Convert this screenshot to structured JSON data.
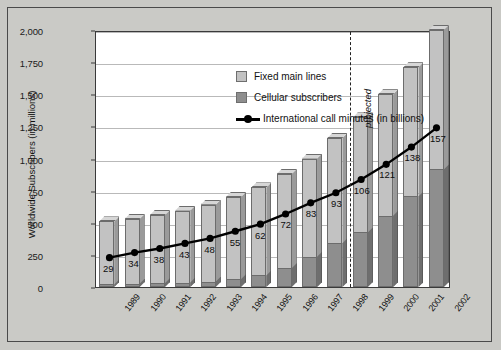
{
  "chart_data": {
    "type": "bar",
    "title": "",
    "subtitle": "",
    "xlabel": "",
    "ylabel": "Worldwide Subscribers (in millions)",
    "ylim": [
      0,
      2000
    ],
    "ytick_labels": [
      "2,000",
      "1,750",
      "1,500",
      "1,250",
      "1,000",
      "750",
      "500",
      "250",
      "0"
    ],
    "ytick_values": [
      2000,
      1750,
      1500,
      1250,
      1000,
      750,
      500,
      250,
      0
    ],
    "grid": true,
    "legend_position": "top-left",
    "stacked": true,
    "categories": [
      "1989",
      "1990",
      "1991",
      "1992",
      "1993",
      "1994",
      "1995",
      "1996",
      "1997",
      "1998",
      "1999",
      "2000",
      "2001",
      "2002"
    ],
    "series": [
      {
        "name": "Cellular subscribers",
        "type": "bar",
        "color": "#8e8e8e",
        "values": [
          20,
          25,
          30,
          35,
          40,
          60,
          90,
          145,
          235,
          340,
          425,
          555,
          705,
          915
        ]
      },
      {
        "name": "Fixed main lines",
        "type": "bar",
        "color": "#c2c2c2",
        "values": [
          490,
          505,
          530,
          560,
          600,
          640,
          685,
          735,
          765,
          820,
          895,
          945,
          1005,
          1085
        ]
      },
      {
        "name": "International call minutes (in billions)",
        "type": "line",
        "color": "#000000",
        "axis": "overlay",
        "values": [
          29,
          34,
          38,
          43,
          48,
          55,
          62,
          72,
          83,
          93,
          106,
          121,
          138,
          157
        ],
        "point_labels": [
          "29",
          "34",
          "38",
          "43",
          "48",
          "55",
          "62",
          "72",
          "83",
          "93",
          "106",
          "121",
          "138",
          "157"
        ]
      }
    ],
    "totals": [
      510,
      530,
      560,
      595,
      640,
      700,
      775,
      880,
      1000,
      1160,
      1320,
      1500,
      1710,
      2000
    ],
    "annotations": [
      {
        "text": "projected",
        "type": "vertical-divider-label",
        "after_category": "1998"
      }
    ]
  },
  "legend": {
    "items": [
      {
        "label": "Fixed main lines",
        "marker": "square-light",
        "color": "#c2c2c2"
      },
      {
        "label": "Cellular subscribers",
        "marker": "square-dark",
        "color": "#8e8e8e"
      },
      {
        "label": "International call minutes (in billions)",
        "marker": "line-dot",
        "color": "#000000"
      }
    ]
  },
  "axes": {
    "y_title": "Worldwide Subscribers (in millions)"
  },
  "annotation": {
    "projected_label": "projected"
  }
}
